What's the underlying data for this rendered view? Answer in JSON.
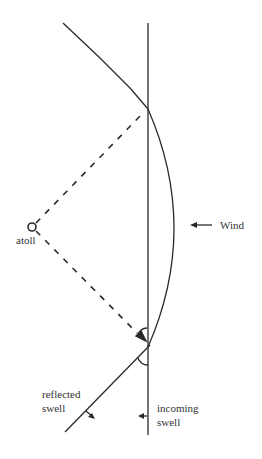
{
  "diagram": {
    "title": "",
    "labels": {
      "wind": "Wind",
      "atoll": "atoll",
      "reflected_swell_line1": "reflected",
      "reflected_swell_line2": "swell",
      "incoming_swell_line1": "incoming",
      "incoming_swell_line2": "swell"
    },
    "elements": [
      {
        "id": "incoming-swell-line",
        "type": "line",
        "style": "solid",
        "description": "vertical incoming swell crest"
      },
      {
        "id": "refracted-upper-line",
        "type": "line",
        "style": "solid",
        "description": "crest bent upward-left from top intersection"
      },
      {
        "id": "reflected-swell-line",
        "type": "line",
        "style": "solid",
        "description": "reflected swell crest going down-left"
      },
      {
        "id": "wind-wave-arc",
        "type": "arc",
        "style": "solid",
        "description": "curved wave front bulging right toward wind"
      },
      {
        "id": "atoll-ray-upper",
        "type": "line",
        "style": "dashed",
        "description": "from atoll to upper intersection"
      },
      {
        "id": "atoll-ray-lower",
        "type": "line",
        "style": "dashed",
        "description": "from atoll to lower intersection with arrowhead"
      },
      {
        "id": "atoll-marker",
        "type": "circle",
        "description": "atoll position"
      },
      {
        "id": "angle-arcs",
        "type": "arc",
        "description": "two equal-angle markers at lower intersection"
      }
    ],
    "arrows": [
      {
        "id": "wind-arrow",
        "direction": "left"
      },
      {
        "id": "incoming-swell-arrow",
        "direction": "left"
      },
      {
        "id": "reflected-swell-arrow",
        "direction": "down-right"
      },
      {
        "id": "ray-arrow",
        "direction": "toward intersection"
      }
    ],
    "colors": {
      "stroke": "#2a2a2a",
      "text": "#333333",
      "background": "#ffffff"
    }
  }
}
